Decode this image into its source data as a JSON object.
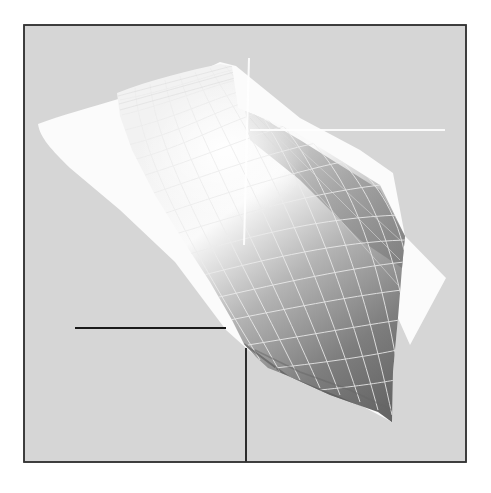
{
  "figure": {
    "colors": {
      "background": "#d6d6d6",
      "frame_border": "#333333",
      "white_sheet": "#fbfbfb",
      "surface_light": "#f4f4f4",
      "surface_dark": "#6e6e6e",
      "grid_lines": "#e8e8e8",
      "black_lines": "#1a1a1a",
      "white_crosshair": "#ffffff"
    },
    "frame": {
      "x": 24,
      "y": 25,
      "width": 442,
      "height": 437
    },
    "white_crosshair": {
      "vertical": {
        "x1": 249,
        "y1": 58,
        "x2": 244,
        "y2": 245
      },
      "horizontal": {
        "x1": 250,
        "y1": 130,
        "x2": 445,
        "y2": 130
      }
    },
    "black_lines": {
      "horizontal": {
        "x1": 75,
        "y1": 328,
        "x2": 226,
        "y2": 328
      },
      "vertical": {
        "x1": 246,
        "y1": 348,
        "x2": 246,
        "y2": 462
      }
    }
  }
}
